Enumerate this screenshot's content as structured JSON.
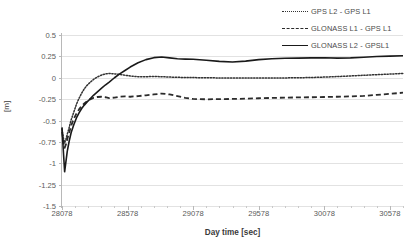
{
  "chart_data": {
    "type": "line",
    "title": "",
    "xlabel": "Day time [sec]",
    "ylabel": "[m]",
    "xlim": [
      28078,
      30678
    ],
    "ylim": [
      -1.5,
      0.5
    ],
    "ytick_labels": [
      "0.5",
      "0.25",
      "0",
      "-0.25",
      "-0.5",
      "-0.75",
      "-1",
      "-1.25",
      "-1.5"
    ],
    "ytick_values": [
      0.5,
      0.25,
      0,
      -0.25,
      -0.5,
      -0.75,
      -1,
      -1.25,
      -1.5
    ],
    "xtick_labels": [
      "28078",
      "28578",
      "29078",
      "29578",
      "30078",
      "30578"
    ],
    "xtick_values": [
      28078,
      28578,
      29078,
      29578,
      30078,
      30578
    ],
    "grid": true,
    "legend_position": "top-right",
    "series": [
      {
        "name": "GPS L2 - GPS L1",
        "style": "dotted",
        "color": "#333333",
        "x": [
          28078,
          28088,
          28098,
          28108,
          28118,
          28133,
          28148,
          28168,
          28188,
          28208,
          28228,
          28248,
          28268,
          28288,
          28318,
          28348,
          28378,
          28408,
          28438,
          28478,
          28518,
          28558,
          28598,
          28658,
          28718,
          28778,
          28838,
          28898,
          28958,
          29018,
          29078,
          29178,
          29278,
          29378,
          29478,
          29578,
          29678,
          29778,
          29878,
          29978,
          30078,
          30178,
          30278,
          30378,
          30478,
          30578,
          30678
        ],
        "y": [
          -0.6,
          -0.7,
          -0.76,
          -0.72,
          -0.66,
          -0.58,
          -0.49,
          -0.4,
          -0.31,
          -0.24,
          -0.18,
          -0.13,
          -0.09,
          -0.06,
          -0.02,
          0.01,
          0.03,
          0.045,
          0.05,
          0.045,
          0.04,
          0.03,
          0.02,
          0.012,
          0.012,
          0.015,
          0.012,
          0.008,
          0.005,
          0.003,
          0.002,
          0.0,
          -0.002,
          -0.003,
          -0.004,
          -0.004,
          -0.003,
          -0.002,
          0.0,
          0.003,
          0.008,
          0.014,
          0.021,
          0.029,
          0.036,
          0.043,
          0.05
        ]
      },
      {
        "name": "GLONASS L1 - GPS L1",
        "style": "dashed",
        "color": "#2b2b2b",
        "x": [
          28078,
          28088,
          28098,
          28108,
          28118,
          28133,
          28148,
          28168,
          28188,
          28208,
          28228,
          28248,
          28268,
          28288,
          28318,
          28348,
          28378,
          28408,
          28438,
          28478,
          28518,
          28558,
          28598,
          28658,
          28718,
          28778,
          28838,
          28898,
          28958,
          29018,
          29078,
          29178,
          29278,
          29378,
          29478,
          29578,
          29678,
          29778,
          29878,
          29978,
          30078,
          30178,
          30278,
          30378,
          30478,
          30578,
          30678
        ],
        "y": [
          -0.63,
          -0.74,
          -0.82,
          -0.78,
          -0.72,
          -0.64,
          -0.56,
          -0.48,
          -0.42,
          -0.37,
          -0.33,
          -0.3,
          -0.275,
          -0.255,
          -0.235,
          -0.225,
          -0.222,
          -0.228,
          -0.238,
          -0.232,
          -0.222,
          -0.218,
          -0.222,
          -0.215,
          -0.205,
          -0.195,
          -0.185,
          -0.195,
          -0.215,
          -0.235,
          -0.248,
          -0.252,
          -0.25,
          -0.248,
          -0.245,
          -0.24,
          -0.236,
          -0.233,
          -0.23,
          -0.228,
          -0.225,
          -0.222,
          -0.218,
          -0.212,
          -0.2,
          -0.188,
          -0.175
        ]
      },
      {
        "name": "GLONASS L2 - GPSL1",
        "style": "solid",
        "color": "#1a1a1a",
        "x": [
          28078,
          28088,
          28098,
          28108,
          28118,
          28133,
          28148,
          28168,
          28188,
          28208,
          28228,
          28248,
          28268,
          28288,
          28318,
          28348,
          28378,
          28408,
          28438,
          28478,
          28518,
          28558,
          28598,
          28658,
          28718,
          28778,
          28838,
          28898,
          28958,
          29018,
          29078,
          29178,
          29278,
          29378,
          29478,
          29578,
          29678,
          29778,
          29878,
          29978,
          30078,
          30178,
          30278,
          30378,
          30478,
          30578,
          30678
        ],
        "y": [
          -0.58,
          -0.85,
          -1.1,
          -0.98,
          -0.86,
          -0.74,
          -0.64,
          -0.55,
          -0.47,
          -0.41,
          -0.36,
          -0.32,
          -0.285,
          -0.255,
          -0.205,
          -0.165,
          -0.125,
          -0.085,
          -0.05,
          0.0,
          0.045,
          0.085,
          0.125,
          0.175,
          0.212,
          0.235,
          0.243,
          0.232,
          0.222,
          0.218,
          0.216,
          0.205,
          0.192,
          0.185,
          0.195,
          0.212,
          0.222,
          0.228,
          0.23,
          0.232,
          0.234,
          0.23,
          0.232,
          0.24,
          0.248,
          0.253,
          0.258
        ]
      }
    ]
  },
  "legend": {
    "items": [
      {
        "label": "GPS L2 - GPS L1"
      },
      {
        "label": "GLONASS L1 - GPS L1"
      },
      {
        "label": "GLONASS L2 - GPSL1"
      }
    ]
  },
  "axes": {
    "x_title": "Day time [sec]",
    "y_title": "[m]"
  }
}
